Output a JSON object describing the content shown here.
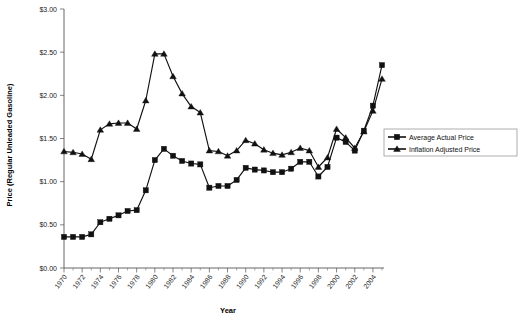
{
  "chart_data": {
    "type": "line",
    "title": "",
    "xlabel": "Year",
    "ylabel": "Price (Regular Unleaded Gasoline)",
    "xlim": [
      1970,
      2005
    ],
    "ylim": [
      0.0,
      3.0
    ],
    "grid": false,
    "legend_position": "right",
    "y_tick_labels": [
      "$0.00",
      "$0.50",
      "$1.00",
      "$1.50",
      "$2.00",
      "$2.50",
      "$3.00"
    ],
    "y_tick_values": [
      0.0,
      0.5,
      1.0,
      1.5,
      2.0,
      2.5,
      3.0
    ],
    "x_tick_labels": [
      "1970",
      "1972",
      "1974",
      "1976",
      "1978",
      "1980",
      "1982",
      "1984",
      "1986",
      "1988",
      "1990",
      "1992",
      "1994",
      "1996",
      "1998",
      "2000",
      "2002",
      "2004"
    ],
    "x_tick_values": [
      1970,
      1972,
      1974,
      1976,
      1978,
      1980,
      1982,
      1984,
      1986,
      1988,
      1990,
      1992,
      1994,
      1996,
      1998,
      2000,
      2002,
      2004
    ],
    "x": [
      1970,
      1971,
      1972,
      1973,
      1974,
      1975,
      1976,
      1977,
      1978,
      1979,
      1980,
      1981,
      1982,
      1983,
      1984,
      1985,
      1986,
      1987,
      1988,
      1989,
      1990,
      1991,
      1992,
      1993,
      1994,
      1995,
      1996,
      1997,
      1998,
      1999,
      2000,
      2001,
      2002,
      2003,
      2004,
      2005
    ],
    "series": [
      {
        "name": "Average Actual Price",
        "marker": "square",
        "color": "#111111",
        "values": [
          0.36,
          0.36,
          0.36,
          0.39,
          0.53,
          0.57,
          0.61,
          0.66,
          0.67,
          0.9,
          1.25,
          1.38,
          1.3,
          1.24,
          1.21,
          1.2,
          0.93,
          0.95,
          0.95,
          1.02,
          1.16,
          1.14,
          1.13,
          1.11,
          1.11,
          1.15,
          1.23,
          1.23,
          1.06,
          1.17,
          1.51,
          1.46,
          1.36,
          1.59,
          1.88,
          2.35
        ]
      },
      {
        "name": "Inflation Adjusted Price",
        "marker": "triangle",
        "color": "#111111",
        "values": [
          1.35,
          1.34,
          1.32,
          1.26,
          1.6,
          1.67,
          1.68,
          1.68,
          1.61,
          1.94,
          2.48,
          2.48,
          2.22,
          2.02,
          1.87,
          1.8,
          1.36,
          1.35,
          1.3,
          1.36,
          1.48,
          1.44,
          1.37,
          1.33,
          1.31,
          1.34,
          1.39,
          1.36,
          1.17,
          1.28,
          1.61,
          1.51,
          1.39,
          1.58,
          1.82,
          2.19
        ]
      }
    ]
  },
  "legend": {
    "items": [
      {
        "label": "Average Actual Price",
        "marker": "square"
      },
      {
        "label": "Inflation Adjusted Price",
        "marker": "triangle"
      }
    ]
  }
}
